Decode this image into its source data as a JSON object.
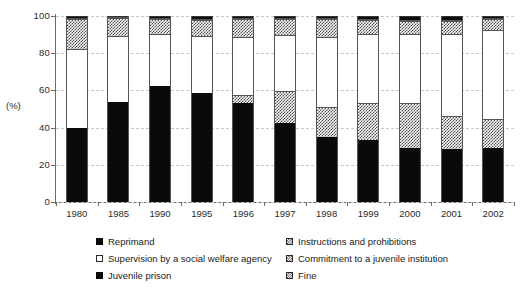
{
  "chart_data": {
    "type": "bar",
    "subtype": "stacked-bar-percent",
    "title": "",
    "xlabel": "",
    "ylabel": "(%)",
    "ylim": [
      0,
      100
    ],
    "yticks": [
      0,
      20,
      40,
      60,
      80,
      100
    ],
    "ytick_labels": [
      "0",
      "20",
      "40",
      "60",
      "80",
      "100"
    ],
    "grid": true,
    "grid_axis": "y",
    "legend_position": "bottom",
    "stack_order_bottom_to_top": [
      "Reprimand",
      "Fine",
      "Supervision by a social welfare agency",
      "Instructions and prohibitions",
      "Commitment to a juvenile institution",
      "Juvenile prison"
    ],
    "categories": [
      "1980",
      "1985",
      "1990",
      "1995",
      "1996",
      "1997",
      "1998",
      "1999",
      "2000",
      "2001",
      "2002"
    ],
    "series": [
      {
        "name": "Reprimand",
        "pattern": "solid-black",
        "values": [
          40.0,
          54.0,
          62.5,
          58.5,
          53.5,
          42.5,
          35.0,
          33.5,
          29.0,
          28.5,
          29.0
        ]
      },
      {
        "name": "Fine",
        "pattern": "checker",
        "values": [
          0.0,
          0.0,
          0.0,
          0.0,
          4.0,
          17.0,
          16.0,
          19.5,
          24.0,
          18.0,
          15.5
        ]
      },
      {
        "name": "Supervision by a social welfare agency",
        "pattern": "open-white",
        "values": [
          42.5,
          35.5,
          28.0,
          31.0,
          31.0,
          30.5,
          37.5,
          37.5,
          37.5,
          44.0,
          48.0
        ]
      },
      {
        "name": "Instructions and prohibitions",
        "pattern": "checker",
        "values": [
          16.0,
          9.5,
          8.0,
          8.5,
          10.0,
          8.5,
          10.0,
          7.5,
          7.0,
          7.0,
          6.0
        ]
      },
      {
        "name": "Commitment to a juvenile institution",
        "pattern": "hatch",
        "values": [
          0.5,
          0.5,
          0.5,
          0.5,
          0.5,
          0.5,
          0.5,
          0.5,
          0.5,
          0.5,
          0.5
        ]
      },
      {
        "name": "Juvenile prison",
        "pattern": "solid-black",
        "values": [
          1.0,
          0.5,
          1.0,
          1.5,
          1.0,
          1.0,
          1.0,
          1.5,
          2.0,
          2.0,
          1.0
        ]
      }
    ]
  },
  "axis": {
    "y_label": "(%)",
    "y_ticks": [
      "0",
      "20",
      "40",
      "60",
      "80",
      "100"
    ],
    "x_ticks": [
      "1980",
      "1985",
      "1990",
      "1995",
      "1996",
      "1997",
      "1998",
      "1999",
      "2000",
      "2001",
      "2002"
    ]
  },
  "legend": {
    "rows": [
      {
        "left": {
          "label": "Reprimand",
          "swatch": "solid"
        },
        "right": {
          "label": "Instructions and prohibitions",
          "swatch": "checker"
        }
      },
      {
        "left": {
          "label": "Supervision by a social welfare agency",
          "swatch": "open"
        },
        "right": {
          "label": "Commitment to a juvenile institution",
          "swatch": "checker"
        }
      },
      {
        "left": {
          "label": "Juvenile prison",
          "swatch": "solid"
        },
        "right": {
          "label": "Fine",
          "swatch": "checker"
        }
      }
    ]
  },
  "colors": {
    "solid": "#0a0a0a",
    "pattern_ink": "#3a3a3a",
    "open": "#ffffff",
    "axis": "#6b6b6b",
    "grid": "#c8c8c8",
    "text": "#1a1a1a"
  }
}
